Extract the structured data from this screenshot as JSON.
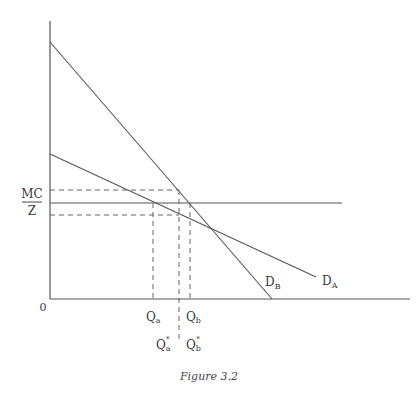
{
  "figure": {
    "caption": "Figure 3.2",
    "origin_label": "0",
    "y_axis_label": {
      "numerator": "MC",
      "denominator": "Z"
    },
    "curves": [
      {
        "name": "D_B",
        "label_main": "D",
        "label_sub": "B",
        "description": "steeper demand curve"
      },
      {
        "name": "D_A",
        "label_main": "D",
        "label_sub": "A",
        "description": "flatter demand curve"
      }
    ],
    "horizontal_line": "MC/Z",
    "x_labels": [
      {
        "main": "Q",
        "sub": "a",
        "star": ""
      },
      {
        "main": "Q",
        "sub": "b",
        "star": ""
      },
      {
        "main": "Q",
        "sub": "a",
        "star": "*"
      },
      {
        "main": "Q",
        "sub": "b",
        "star": "*"
      }
    ],
    "colors": {
      "line": "#555555",
      "text": "#3a3a3a",
      "background": "#ffffff"
    }
  }
}
